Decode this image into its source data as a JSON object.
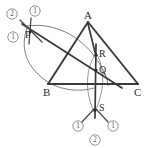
{
  "figure": {
    "kind": "geometry-construction",
    "width": 154,
    "height": 148,
    "background_color": "#ffffff",
    "line_color": "#3a3a3a",
    "arc_color": "#7d7d7d",
    "label_color": "#2b2b2b",
    "step_color": "#777777"
  },
  "triangle": {
    "name": "triangle-abc",
    "vertices": [
      {
        "id": "A",
        "label": "A",
        "x": 88,
        "y": 22,
        "label_x": 84,
        "label_y": 19
      },
      {
        "id": "B",
        "label": "B",
        "x": 48,
        "y": 84,
        "label_x": 43,
        "label_y": 96
      },
      {
        "id": "C",
        "label": "C",
        "x": 138,
        "y": 84,
        "label_x": 134,
        "label_y": 96
      }
    ],
    "sides": [
      {
        "id": "AB",
        "from": "A",
        "to": "B"
      },
      {
        "id": "BC",
        "from": "B",
        "to": "C"
      },
      {
        "id": "CA",
        "from": "C",
        "to": "A"
      }
    ]
  },
  "points": [
    {
      "id": "P",
      "label": "P",
      "x": 30,
      "y": 32,
      "label_x": 25,
      "label_y": 38
    },
    {
      "id": "R",
      "label": "R",
      "x": 96,
      "y": 55,
      "label_x": 99,
      "label_y": 57
    },
    {
      "id": "Q",
      "label": "Q",
      "x": 96,
      "y": 70,
      "label_x": 99,
      "label_y": 73
    },
    {
      "id": "S",
      "label": "S",
      "x": 95,
      "y": 110,
      "label_x": 99,
      "label_y": 111
    }
  ],
  "step_markers": [
    {
      "id": "p-upper-left",
      "label": "2",
      "x": 12,
      "y": 14
    },
    {
      "id": "p-upper-right",
      "label": "1",
      "x": 35,
      "y": 11
    },
    {
      "id": "p-lower-left",
      "label": "1",
      "x": 13,
      "y": 37
    },
    {
      "id": "s-left",
      "label": "1",
      "x": 78,
      "y": 126
    },
    {
      "id": "s-right",
      "label": "1",
      "x": 113,
      "y": 126
    },
    {
      "id": "s-bottom",
      "label": "2",
      "x": 95,
      "y": 140
    }
  ],
  "construction_lines": [
    {
      "id": "line-P-through-Q",
      "from_x": 22,
      "to_x": 122,
      "note": "straight line from P descending to the right through Q"
    },
    {
      "id": "line-vertical-RQS",
      "note": "vertical line through R, Q and S"
    },
    {
      "id": "line-A-to-S",
      "note": "line from A downward through R and Q to S"
    }
  ],
  "arcs": [
    {
      "id": "large-arc-from-P",
      "note": "wide arc swung from near B through P and down across BC"
    },
    {
      "id": "lens-arc-left",
      "note": "left arc of vesica between R and S"
    },
    {
      "id": "lens-arc-right",
      "note": "right arc of vesica between R and S"
    },
    {
      "id": "tick-arc-at-P",
      "note": "crossing compass ticks locating P"
    },
    {
      "id": "tick-arc-at-S",
      "note": "crossing compass ticks locating S"
    }
  ]
}
